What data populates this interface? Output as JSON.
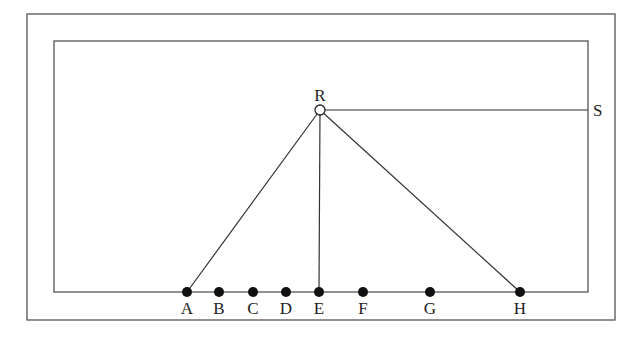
{
  "diagram": {
    "colors": {
      "stroke": "#555555",
      "line": "#333333",
      "point": "#111111",
      "background": "#ffffff"
    },
    "frames": {
      "outer": {
        "x": 27,
        "y": 14,
        "w": 588,
        "h": 306
      },
      "inner": {
        "x": 54,
        "y": 41,
        "w": 534,
        "h": 251
      }
    },
    "apex": {
      "label": "R",
      "x": 320,
      "y": 110
    },
    "side_point": {
      "label": "S",
      "x": 588,
      "y": 110
    },
    "baseline_y": 292,
    "points": [
      {
        "label": "A",
        "x": 187
      },
      {
        "label": "B",
        "x": 219
      },
      {
        "label": "C",
        "x": 253
      },
      {
        "label": "D",
        "x": 286
      },
      {
        "label": "E",
        "x": 319
      },
      {
        "label": "F",
        "x": 363
      },
      {
        "label": "G",
        "x": 430
      },
      {
        "label": "H",
        "x": 520
      }
    ],
    "segments": [
      {
        "from": "R",
        "to": "A"
      },
      {
        "from": "R",
        "to": "E"
      },
      {
        "from": "R",
        "to": "H"
      },
      {
        "from": "R",
        "to": "S"
      }
    ]
  }
}
